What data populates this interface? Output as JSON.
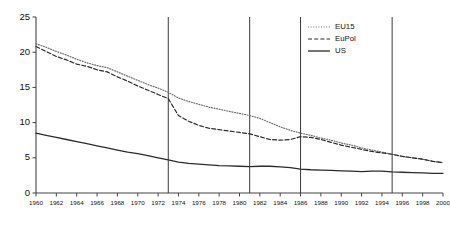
{
  "chart_data": {
    "type": "line",
    "title": "",
    "subtitle": "",
    "xlabel": "",
    "ylabel": "",
    "xlim": [
      1960,
      2000
    ],
    "ylim": [
      0,
      25
    ],
    "ytick_values": [
      0,
      5,
      10,
      15,
      20,
      25
    ],
    "ytick_labels": [
      "0",
      "5",
      "10",
      "15",
      "20",
      "25"
    ],
    "xtick_values": [
      1960,
      1962,
      1964,
      1966,
      1968,
      1970,
      1972,
      1974,
      1976,
      1978,
      1980,
      1982,
      1984,
      1986,
      1988,
      1990,
      1992,
      1994,
      1996,
      1998,
      2000
    ],
    "xtick_labels": [
      "1960",
      "1962",
      "1964",
      "1966",
      "1968",
      "1970",
      "1972",
      "1974",
      "1976",
      "1978",
      "1980",
      "1982",
      "1984",
      "1986",
      "1988",
      "1990",
      "1992",
      "1994",
      "1996",
      "1998",
      "2000"
    ],
    "grid": false,
    "legend_position": "top-right",
    "x": [
      1960,
      1961,
      1962,
      1963,
      1964,
      1965,
      1966,
      1967,
      1968,
      1969,
      1970,
      1971,
      1972,
      1973,
      1974,
      1975,
      1976,
      1977,
      1978,
      1979,
      1980,
      1981,
      1982,
      1983,
      1984,
      1985,
      1986,
      1987,
      1988,
      1989,
      1990,
      1991,
      1992,
      1993,
      1994,
      1995,
      1996,
      1997,
      1998,
      1999,
      2000
    ],
    "series": [
      {
        "name": "EU15",
        "style": "dotted",
        "color": "#6f6f6f",
        "values": [
          21.2,
          20.7,
          20.1,
          19.6,
          19.0,
          18.5,
          18.1,
          17.8,
          17.2,
          16.6,
          16.0,
          15.4,
          14.9,
          14.3,
          13.5,
          13.0,
          12.6,
          12.2,
          11.9,
          11.6,
          11.3,
          11.0,
          10.6,
          10.0,
          9.4,
          8.9,
          8.5,
          8.2,
          7.8,
          7.5,
          7.1,
          6.8,
          6.4,
          6.1,
          5.8,
          5.5,
          5.2,
          5.0,
          4.8,
          4.5,
          4.3
        ]
      },
      {
        "name": "EuPol",
        "style": "dashed",
        "color": "#2b2b2b",
        "values": [
          20.8,
          20.1,
          19.4,
          18.9,
          18.3,
          18.0,
          17.5,
          17.2,
          16.5,
          15.9,
          15.2,
          14.6,
          14.0,
          13.4,
          11.0,
          10.2,
          9.6,
          9.2,
          9.0,
          8.8,
          8.6,
          8.4,
          8.0,
          7.6,
          7.5,
          7.6,
          8.0,
          7.9,
          7.6,
          7.2,
          6.8,
          6.5,
          6.2,
          5.9,
          5.7,
          5.5,
          5.2,
          5.0,
          4.8,
          4.5,
          4.3
        ]
      },
      {
        "name": "US",
        "style": "solid",
        "color": "#2b2b2b",
        "values": [
          8.5,
          8.2,
          7.9,
          7.6,
          7.3,
          7.0,
          6.7,
          6.4,
          6.1,
          5.8,
          5.6,
          5.3,
          5.0,
          4.7,
          4.4,
          4.2,
          4.1,
          4.0,
          3.9,
          3.85,
          3.8,
          3.75,
          3.8,
          3.8,
          3.7,
          3.6,
          3.4,
          3.3,
          3.25,
          3.2,
          3.15,
          3.1,
          3.05,
          3.1,
          3.1,
          3.0,
          2.95,
          2.9,
          2.85,
          2.8,
          2.8
        ]
      }
    ],
    "vertical_reference_lines": [
      {
        "year": 1973,
        "label": ""
      },
      {
        "year": 1981,
        "label": ""
      },
      {
        "year": 1986,
        "label": ""
      },
      {
        "year": 1995,
        "label": ""
      }
    ]
  },
  "legend": {
    "entries": [
      {
        "label": "EU15"
      },
      {
        "label": "EuPol"
      },
      {
        "label": "US"
      }
    ]
  }
}
